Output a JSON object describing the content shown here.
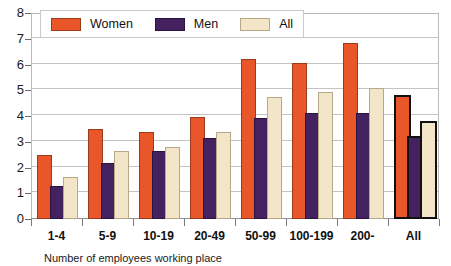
{
  "chart_data": {
    "type": "bar",
    "title": "",
    "xlabel": "",
    "ylabel": "",
    "ylim": [
      0,
      8
    ],
    "yticks": [
      0,
      1,
      2,
      3,
      4,
      5,
      6,
      7,
      8
    ],
    "ytick_labels": [
      "0",
      "1",
      "2",
      "3",
      "4",
      "5",
      "6",
      "7",
      "8"
    ],
    "grid": true,
    "legend_position": "top-left",
    "categories": [
      "1-4",
      "5-9",
      "10-19",
      "20-49",
      "50-99",
      "100-199",
      "200-",
      "All"
    ],
    "series": [
      {
        "name": "Women",
        "color": "#E8562A",
        "values": [
          2.4,
          3.4,
          3.3,
          3.9,
          6.15,
          6.0,
          6.75,
          4.65
        ]
      },
      {
        "name": "Men",
        "color": "#44215F",
        "values": [
          1.2,
          2.1,
          2.55,
          3.05,
          3.85,
          4.05,
          4.05,
          3.05
        ]
      },
      {
        "name": "All",
        "color": "#F2E5C8",
        "values": [
          1.55,
          2.55,
          2.7,
          3.3,
          4.65,
          4.85,
          5.0,
          3.65
        ]
      }
    ],
    "highlighted_category": "All",
    "highlight_outline_color": "#111111"
  },
  "legend": {
    "entries": [
      {
        "label": "Women",
        "color": "#E8562A"
      },
      {
        "label": "Men",
        "color": "#44215F"
      },
      {
        "label": "All",
        "color": "#F2E5C8"
      }
    ]
  },
  "caption": {
    "text": "Number of employees working place"
  },
  "colors": {
    "women": "#E8562A",
    "men": "#44215F",
    "all": "#F2E5C8",
    "gridline": "#c4c4c4",
    "axis": "#8e8e8e",
    "text": "#111111"
  }
}
